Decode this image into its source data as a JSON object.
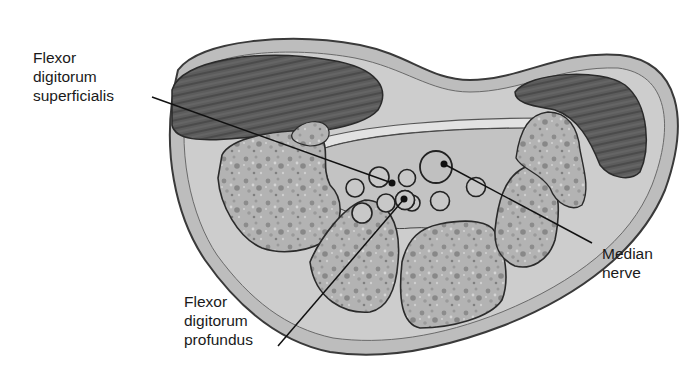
{
  "figure": {
    "labels": {
      "flexor_digitorum_superficialis": "Flexor\ndigitorum\nsuperficialis",
      "flexor_digitorum_profundus": "Flexor\ndigitorum\nprofundus",
      "median_nerve": "Median\nnerve"
    },
    "colors": {
      "skin_outer": "#b9b9b9",
      "soft_tissue": "#cfcfcf",
      "muscle": "#5a5a5a",
      "bone": "#a9a9a9",
      "tendon_fill": "#c4c4c4",
      "outline": "#2a2a2a",
      "leader_line": "#111111"
    }
  }
}
